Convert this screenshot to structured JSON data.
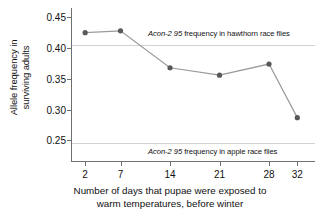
{
  "chart_data": {
    "type": "line",
    "title": "",
    "xlabel": "Number of days that pupae were exposed to warm temperatures, before winter",
    "xlabel_line1": "Number of days that pupae were exposed to",
    "xlabel_line2": "warm temperatures, before winter",
    "ylabel": "Allele frequency in surviving adults",
    "ylabel_line1": "Allele frequency in",
    "ylabel_line2": "surviving adults",
    "x": [
      2,
      7,
      14,
      21,
      28,
      32
    ],
    "xtick_labels": [
      "2",
      "7",
      "14",
      "21",
      "28",
      "32"
    ],
    "values": [
      0.425,
      0.428,
      0.368,
      0.356,
      0.374,
      0.287
    ],
    "ytick_labels": [
      "0.45",
      "0.40",
      "0.35",
      "0.30",
      "0.25"
    ],
    "yticks": [
      0.45,
      0.4,
      0.35,
      0.3,
      0.25
    ],
    "ylim": [
      0.215,
      0.465
    ],
    "xlim": [
      0,
      34.5
    ],
    "grid": false,
    "legend": "none",
    "series": [
      {
        "name": "Allele frequency in surviving adults",
        "values": [
          0.425,
          0.428,
          0.368,
          0.356,
          0.374,
          0.287
        ],
        "marker_color": "#585858",
        "line_color": "#9a9a9a"
      }
    ],
    "reference_lines": [
      {
        "name": "hawthorn-race-reference",
        "value": 0.405,
        "color": "#d2d2d2",
        "gene_label": "Acon-2 95",
        "rest_label": " frequency in hawthorn race flies",
        "label": "Acon-2 95 frequency in hawthorn race flies"
      },
      {
        "name": "apple-race-reference",
        "value": 0.2455,
        "color": "#d2d2d2",
        "gene_label": "Acon-2 95",
        "rest_label": " frequency in apple race flies",
        "label": "Acon-2 95 frequency in apple race flies"
      }
    ],
    "axis_color": "#6f6f6f",
    "background": "#ffffff"
  }
}
